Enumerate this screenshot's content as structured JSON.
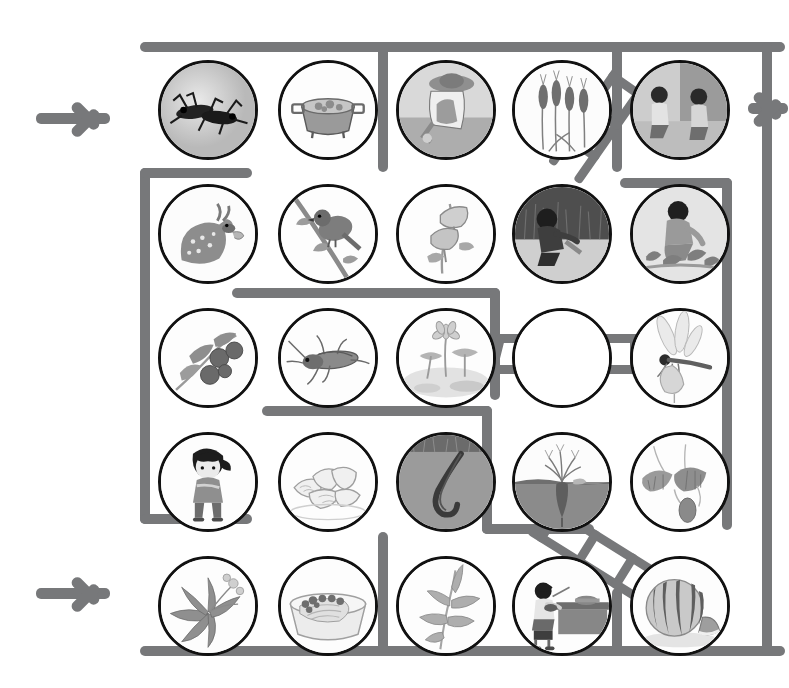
{
  "page": {
    "type": "maze-puzzle",
    "background_color": "#ffffff",
    "wall_color": "#77787a",
    "circle_border_color": "#111111",
    "grid": {
      "rows": 5,
      "cols": 5,
      "cell_diameter_px": 100
    }
  },
  "arrows": [
    {
      "name": "entry-arrow-top-left",
      "label": "→",
      "direction": "right",
      "x": 36,
      "y": 90,
      "cut_off": false
    },
    {
      "name": "entry-arrow-bottom-left",
      "label": "→",
      "direction": "right",
      "x": 36,
      "y": 565,
      "cut_off": false
    },
    {
      "name": "exit-arrow-right",
      "label": "→",
      "direction": "right",
      "x": 748,
      "y": 80,
      "cut_off": true
    }
  ],
  "cells": [
    {
      "row": 1,
      "col": 1,
      "name": "cell-crickets",
      "subject": "two crickets / insects"
    },
    {
      "row": 1,
      "col": 2,
      "name": "cell-pot-of-stew",
      "subject": "pot of cooked food / stew"
    },
    {
      "row": 1,
      "col": 3,
      "name": "cell-farmer-harvesting",
      "subject": "farmer in hat harvesting crop"
    },
    {
      "row": 1,
      "col": 4,
      "name": "cell-wheat-ears",
      "subject": "ears of wheat"
    },
    {
      "row": 1,
      "col": 5,
      "name": "cell-two-children-crouching",
      "subject": "two children crouching indoors"
    },
    {
      "row": 2,
      "col": 1,
      "name": "cell-spotted-deer",
      "subject": "spotted deer / fawn"
    },
    {
      "row": 2,
      "col": 2,
      "name": "cell-bird-on-branch",
      "subject": "bird perched on branch"
    },
    {
      "row": 2,
      "col": 3,
      "name": "cell-morning-glory",
      "subject": "morning glory flowers"
    },
    {
      "row": 2,
      "col": 4,
      "name": "cell-child-digging-grass",
      "subject": "child digging in grass"
    },
    {
      "row": 2,
      "col": 5,
      "name": "cell-child-picking-plants",
      "subject": "child picking low plants"
    },
    {
      "row": 3,
      "col": 1,
      "name": "cell-berries-branch",
      "subject": "branch with dark berries"
    },
    {
      "row": 3,
      "col": 2,
      "name": "cell-cricket",
      "subject": "single cricket / grasshopper"
    },
    {
      "row": 3,
      "col": 3,
      "name": "cell-lotus-pond",
      "subject": "lotus flower in pond"
    },
    {
      "row": 3,
      "col": 4,
      "name": "cell-empty-no-picture",
      "subject": "empty circle (no illustration)"
    },
    {
      "row": 3,
      "col": 5,
      "name": "cell-dragonfly",
      "subject": "dragonfly"
    },
    {
      "row": 4,
      "col": 1,
      "name": "cell-girl-standing",
      "subject": "girl standing with braid"
    },
    {
      "row": 4,
      "col": 2,
      "name": "cell-dumplings",
      "subject": "plate of dumplings"
    },
    {
      "row": 4,
      "col": 3,
      "name": "cell-earthworm-soil",
      "subject": "earthworm in soil"
    },
    {
      "row": 4,
      "col": 4,
      "name": "cell-radish-in-ground",
      "subject": "radish growing in ground"
    },
    {
      "row": 4,
      "col": 5,
      "name": "cell-hanging-fruit",
      "subject": "fruit hanging from leafy vine"
    },
    {
      "row": 5,
      "col": 1,
      "name": "cell-leafy-herb-plant",
      "subject": "leafy herb plant with flowers"
    },
    {
      "row": 5,
      "col": 2,
      "name": "cell-bowl-of-cabbage",
      "subject": "bowl of cabbage dish"
    },
    {
      "row": 5,
      "col": 3,
      "name": "cell-bamboo-leaves",
      "subject": "bamboo / leafy stem"
    },
    {
      "row": 5,
      "col": 4,
      "name": "cell-child-eating-at-table",
      "subject": "child eating at table"
    },
    {
      "row": 5,
      "col": 5,
      "name": "cell-watermelon",
      "subject": "watermelon with cut slice"
    }
  ],
  "walls": [
    {
      "name": "wall-outer-top",
      "x": 140,
      "y": 42,
      "w": 645,
      "h": 10
    },
    {
      "name": "wall-outer-bottom",
      "x": 140,
      "y": 646,
      "w": 645,
      "h": 10
    },
    {
      "name": "wall-outer-right",
      "x": 762,
      "y": 42,
      "w": 10,
      "h": 614
    },
    {
      "name": "wall-v-col2-top",
      "x": 378,
      "y": 47,
      "w": 10,
      "h": 125
    },
    {
      "name": "wall-v-col4-top",
      "x": 612,
      "y": 47,
      "w": 10,
      "h": 125
    },
    {
      "name": "wall-left-vertical",
      "x": 140,
      "y": 168,
      "w": 10,
      "h": 356
    },
    {
      "name": "wall-left-top-stub",
      "x": 140,
      "y": 168,
      "w": 110,
      "h": 10
    },
    {
      "name": "wall-left-bot-stub",
      "x": 140,
      "y": 514,
      "w": 110,
      "h": 10
    },
    {
      "name": "wall-h-row2-mid",
      "x": 232,
      "y": 288,
      "w": 268,
      "h": 10
    },
    {
      "name": "wall-v-row2-short",
      "x": 490,
      "y": 288,
      "w": 10,
      "h": 112
    },
    {
      "name": "wall-h-row3-left",
      "x": 262,
      "y": 406,
      "w": 230,
      "h": 10
    },
    {
      "name": "wall-v-row3-down",
      "x": 482,
      "y": 406,
      "w": 10,
      "h": 126
    },
    {
      "name": "wall-h-row4-right",
      "x": 482,
      "y": 532,
      "w": 110,
      "h": 10
    },
    {
      "name": "wall-v-right-inner",
      "x": 722,
      "y": 178,
      "w": 10,
      "h": 350
    },
    {
      "name": "wall-h-right-top",
      "x": 622,
      "y": 178,
      "w": 110,
      "h": 10
    },
    {
      "name": "wall-v-col2-bottom",
      "x": 378,
      "y": 532,
      "w": 10,
      "h": 120
    },
    {
      "name": "wall-v-col4-bottom",
      "x": 612,
      "y": 596,
      "w": 10,
      "h": 56
    }
  ],
  "ladders": [
    {
      "name": "ladder-diagonal-top-right",
      "from_x": 640,
      "from_y": 92,
      "to_x": 572,
      "to_y": 190,
      "rungs": 3,
      "note": "diagonal ladder between row1-col5 and row2-col4"
    },
    {
      "name": "ladder-horizontal-middle",
      "from_x": 490,
      "from_y": 345,
      "to_x": 640,
      "to_y": 345,
      "rungs": 4,
      "note": "horizontal ladder across row3 cols 3-5"
    },
    {
      "name": "ladder-diagonal-bottom-right",
      "from_x": 560,
      "from_y": 510,
      "to_x": 690,
      "to_y": 590,
      "rungs": 4,
      "note": "diagonal ladder down to watermelon cell"
    }
  ]
}
